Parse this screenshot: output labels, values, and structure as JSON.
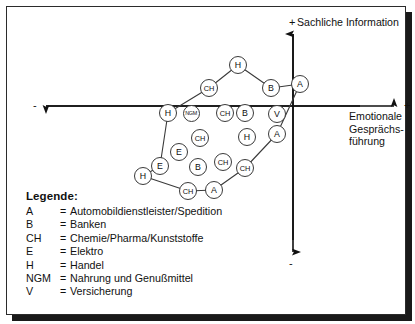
{
  "figure": {
    "axes": {
      "vertical_label": "Sachliche Information",
      "vertical_plus": "+",
      "vertical_minus": "-",
      "horizontal_label": "Emotionale Gesprächs-führung",
      "horizontal_label_lines": [
        "Emotionale",
        "Gesprächs-",
        "führung"
      ],
      "horizontal_plus": "+",
      "horizontal_minus": "-"
    },
    "legend": {
      "title": "Legende:",
      "separator": "=",
      "entries": [
        {
          "key": "A",
          "value": "Automobildienstleister/Spedition"
        },
        {
          "key": "B",
          "value": "Banken"
        },
        {
          "key": "CH",
          "value": "Chemie/Pharma/Kunststoffe"
        },
        {
          "key": "E",
          "value": "Elektro"
        },
        {
          "key": "H",
          "value": "Handel"
        },
        {
          "key": "NGM",
          "value": "Nahrung und Genußmittel"
        },
        {
          "key": "V",
          "value": "Versicherung"
        }
      ]
    }
  },
  "chart_data": {
    "type": "scatter",
    "title": "",
    "xlabel": "Emotionale Gesprächsführung",
    "ylabel": "Sachliche Information",
    "xlim": [
      -1,
      1
    ],
    "ylim": [
      -1,
      1
    ],
    "grid": false,
    "legend_position": "below-left",
    "axis_origin_px": [
      293,
      106
    ],
    "points": [
      {
        "label": "H",
        "x": 238,
        "y": 65,
        "size": "m",
        "hull": true
      },
      {
        "label": "CH",
        "x": 209,
        "y": 88,
        "size": "m",
        "hull": true
      },
      {
        "label": "B",
        "x": 271,
        "y": 88,
        "size": "m",
        "hull": true
      },
      {
        "label": "A",
        "x": 300,
        "y": 84,
        "size": "m",
        "hull": true
      },
      {
        "label": "H",
        "x": 168,
        "y": 113,
        "size": "m",
        "hull": true
      },
      {
        "label": "NGM",
        "x": 191,
        "y": 113,
        "size": "s",
        "hull": false
      },
      {
        "label": "CH",
        "x": 225,
        "y": 113,
        "size": "m",
        "hull": false
      },
      {
        "label": "B",
        "x": 245,
        "y": 113,
        "size": "m",
        "hull": false
      },
      {
        "label": "V",
        "x": 277,
        "y": 114,
        "size": "m",
        "hull": false
      },
      {
        "label": "CH",
        "x": 200,
        "y": 138,
        "size": "m",
        "hull": false
      },
      {
        "label": "H",
        "x": 247,
        "y": 137,
        "size": "m",
        "hull": false
      },
      {
        "label": "A",
        "x": 277,
        "y": 134,
        "size": "m",
        "hull": true
      },
      {
        "label": "E",
        "x": 179,
        "y": 152,
        "size": "m",
        "hull": false
      },
      {
        "label": "E",
        "x": 160,
        "y": 166,
        "size": "m",
        "hull": true
      },
      {
        "label": "B",
        "x": 198,
        "y": 167,
        "size": "m",
        "hull": false
      },
      {
        "label": "CH",
        "x": 223,
        "y": 162,
        "size": "m",
        "hull": false
      },
      {
        "label": "CH",
        "x": 245,
        "y": 168,
        "size": "m",
        "hull": true
      },
      {
        "label": "H",
        "x": 143,
        "y": 176,
        "size": "m",
        "hull": true
      },
      {
        "label": "CH",
        "x": 188,
        "y": 191,
        "size": "m",
        "hull": true
      },
      {
        "label": "A",
        "x": 214,
        "y": 190,
        "size": "m",
        "hull": true
      }
    ],
    "hull_path": [
      [
        238,
        65
      ],
      [
        271,
        88
      ],
      [
        300,
        84
      ],
      [
        277,
        134
      ],
      [
        245,
        168
      ],
      [
        214,
        190
      ],
      [
        188,
        191
      ],
      [
        143,
        176
      ],
      [
        160,
        166
      ],
      [
        168,
        113
      ],
      [
        209,
        88
      ]
    ]
  }
}
